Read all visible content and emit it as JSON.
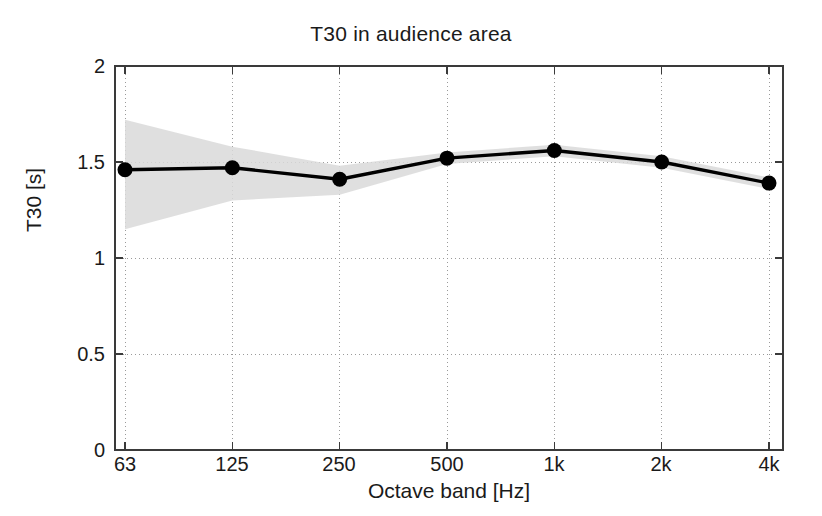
{
  "chart_data": {
    "type": "line",
    "title": "T30 in audience area",
    "xlabel": "Octave band [Hz]",
    "ylabel": "T30 [s]",
    "categories": [
      "63",
      "125",
      "250",
      "500",
      "1k",
      "2k",
      "4k"
    ],
    "series": [
      {
        "name": "T30 mean",
        "values": [
          1.46,
          1.47,
          1.41,
          1.52,
          1.56,
          1.5,
          1.39
        ],
        "marker": "filled-circle",
        "color": "#000000"
      }
    ],
    "band": {
      "name": "standard deviation envelope",
      "color": "#d9d9d9",
      "upper": [
        1.72,
        1.58,
        1.48,
        1.55,
        1.59,
        1.53,
        1.42
      ],
      "lower": [
        1.15,
        1.3,
        1.33,
        1.49,
        1.53,
        1.47,
        1.36
      ]
    },
    "xticklabels": [
      "63",
      "125",
      "250",
      "500",
      "1k",
      "2k",
      "4k"
    ],
    "yticklabels": [
      "0",
      "0.5",
      "1",
      "1.5",
      "2"
    ],
    "yticks": [
      0,
      0.5,
      1,
      1.5,
      2
    ],
    "ylim": [
      0,
      2
    ],
    "grid": "dotted-both-axes",
    "legend": "none"
  },
  "axes": {
    "frame_color": "#3a3a3a",
    "grid_color": "#9a9a9a",
    "background": "#ffffff"
  }
}
